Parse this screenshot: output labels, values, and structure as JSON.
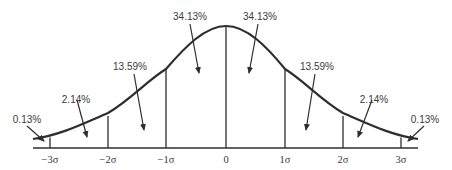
{
  "diagram": {
    "type": "normal-distribution",
    "colors": {
      "ink": "#2e2e2e",
      "text": "#3a3a3a",
      "background": "#ffffff"
    },
    "axis_labels": [
      "−3σ",
      "−2σ",
      "−1σ",
      "0",
      "1σ",
      "2σ",
      "3σ"
    ],
    "regions": [
      {
        "label": "0.13%",
        "from": "-inf",
        "to": "-3σ"
      },
      {
        "label": "2.14%",
        "from": "-3σ",
        "to": "-2σ"
      },
      {
        "label": "13.59%",
        "from": "-2σ",
        "to": "-1σ"
      },
      {
        "label": "34.13%",
        "from": "-1σ",
        "to": "0"
      },
      {
        "label": "34.13%",
        "from": "0",
        "to": "1σ"
      },
      {
        "label": "13.59%",
        "from": "1σ",
        "to": "2σ"
      },
      {
        "label": "2.14%",
        "from": "2σ",
        "to": "3σ"
      },
      {
        "label": "0.13%",
        "from": "3σ",
        "to": "+inf"
      }
    ]
  }
}
